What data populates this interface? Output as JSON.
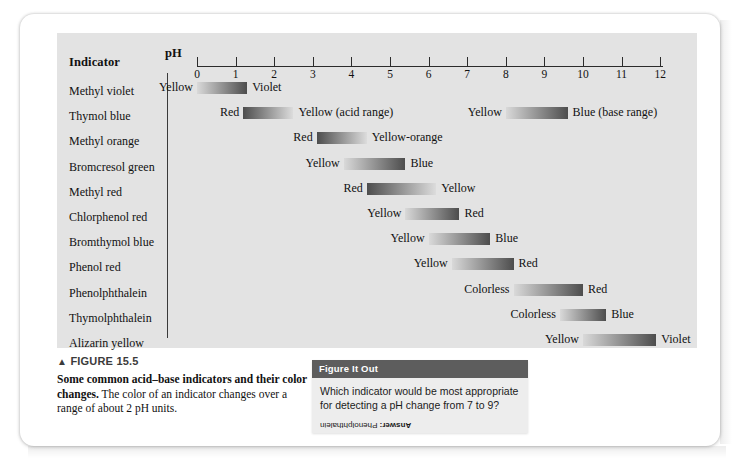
{
  "figure": {
    "label": "FIGURE 15.5",
    "triangle": "▲",
    "caption_bold": "Some common acid–base indicators and their color changes.",
    "caption_rest": " The color of an indicator changes over a range of about 2 pH units."
  },
  "table": {
    "indicator_header": "Indicator",
    "ph_header": "pH"
  },
  "figure_it_out": {
    "header": "Figure It Out",
    "question": "Which indicator would be most appropriate for detecting a pH change from 7 to 9?",
    "answer_prefix": "Answer:",
    "answer": " Phenolphthalein"
  },
  "chart_data": {
    "type": "bar",
    "title": "Some common acid–base indicators and their color changes",
    "xlabel": "pH",
    "ylabel": "Indicator",
    "xlim": [
      0,
      12
    ],
    "ticks": [
      0,
      1,
      2,
      3,
      4,
      5,
      6,
      7,
      8,
      9,
      10,
      11,
      12
    ],
    "grid": false,
    "legend": "none",
    "note": "Each bar is a grayscale gradient spanning the pH transition interval of the indicator; the label at each end names the color of the acid form (left) and base form (right).",
    "categories": [
      "Methyl violet",
      "Thymol blue",
      "Methyl orange",
      "Bromcresol green",
      "Methyl red",
      "Chlorphenol red",
      "Bromthymol blue",
      "Phenol red",
      "Phenolphthalein",
      "Thymolphthalein",
      "Alizarin yellow"
    ],
    "rows": [
      {
        "indicator": "Methyl violet",
        "segments": [
          {
            "ph_start": 0.0,
            "ph_end": 1.3,
            "acid_color_label": "Yellow",
            "base_color_label": "Violet",
            "gradient": "light-to-dark",
            "range_note": ""
          }
        ]
      },
      {
        "indicator": "Thymol blue",
        "segments": [
          {
            "ph_start": 1.2,
            "ph_end": 2.5,
            "acid_color_label": "Red",
            "base_color_label": "Yellow (acid range)",
            "gradient": "dark-to-light",
            "range_note": "acid range"
          },
          {
            "ph_start": 8.0,
            "ph_end": 9.6,
            "acid_color_label": "Yellow",
            "base_color_label": "Blue (base range)",
            "gradient": "light-to-dark",
            "range_note": "base range"
          }
        ]
      },
      {
        "indicator": "Methyl orange",
        "segments": [
          {
            "ph_start": 3.1,
            "ph_end": 4.4,
            "acid_color_label": "Red",
            "base_color_label": "Yellow-orange",
            "gradient": "dark-to-light",
            "range_note": ""
          }
        ]
      },
      {
        "indicator": "Bromcresol green",
        "segments": [
          {
            "ph_start": 3.8,
            "ph_end": 5.4,
            "acid_color_label": "Yellow",
            "base_color_label": "Blue",
            "gradient": "light-to-dark",
            "range_note": ""
          }
        ]
      },
      {
        "indicator": "Methyl red",
        "segments": [
          {
            "ph_start": 4.4,
            "ph_end": 6.2,
            "acid_color_label": "Red",
            "base_color_label": "Yellow",
            "gradient": "dark-to-light",
            "range_note": ""
          }
        ]
      },
      {
        "indicator": "Chlorphenol red",
        "segments": [
          {
            "ph_start": 5.4,
            "ph_end": 6.8,
            "acid_color_label": "Yellow",
            "base_color_label": "Red",
            "gradient": "light-to-dark",
            "range_note": ""
          }
        ]
      },
      {
        "indicator": "Bromthymol blue",
        "segments": [
          {
            "ph_start": 6.0,
            "ph_end": 7.6,
            "acid_color_label": "Yellow",
            "base_color_label": "Blue",
            "gradient": "light-to-dark",
            "range_note": ""
          }
        ]
      },
      {
        "indicator": "Phenol red",
        "segments": [
          {
            "ph_start": 6.6,
            "ph_end": 8.2,
            "acid_color_label": "Yellow",
            "base_color_label": "Red",
            "gradient": "light-to-dark",
            "range_note": ""
          }
        ]
      },
      {
        "indicator": "Phenolphthalein",
        "segments": [
          {
            "ph_start": 8.2,
            "ph_end": 10.0,
            "acid_color_label": "Colorless",
            "base_color_label": "Red",
            "gradient": "light-to-dark",
            "range_note": ""
          }
        ]
      },
      {
        "indicator": "Thymolphthalein",
        "segments": [
          {
            "ph_start": 9.4,
            "ph_end": 10.6,
            "acid_color_label": "Colorless",
            "base_color_label": "Blue",
            "gradient": "light-to-dark",
            "range_note": ""
          }
        ]
      },
      {
        "indicator": "Alizarin yellow",
        "segments": [
          {
            "ph_start": 10.0,
            "ph_end": 11.9,
            "acid_color_label": "Yellow",
            "base_color_label": "Violet",
            "gradient": "light-to-dark",
            "range_note": ""
          }
        ]
      }
    ]
  },
  "colors": {
    "panel_bg": "#e3e3e3",
    "page_bg": "#ffffff",
    "bar_light": "#d9d9d9",
    "bar_dark": "#4d4d4d",
    "axis": "#2b2b2b",
    "fio_header_bg": "#5d5d5d",
    "fio_body_bg": "#ededed"
  }
}
